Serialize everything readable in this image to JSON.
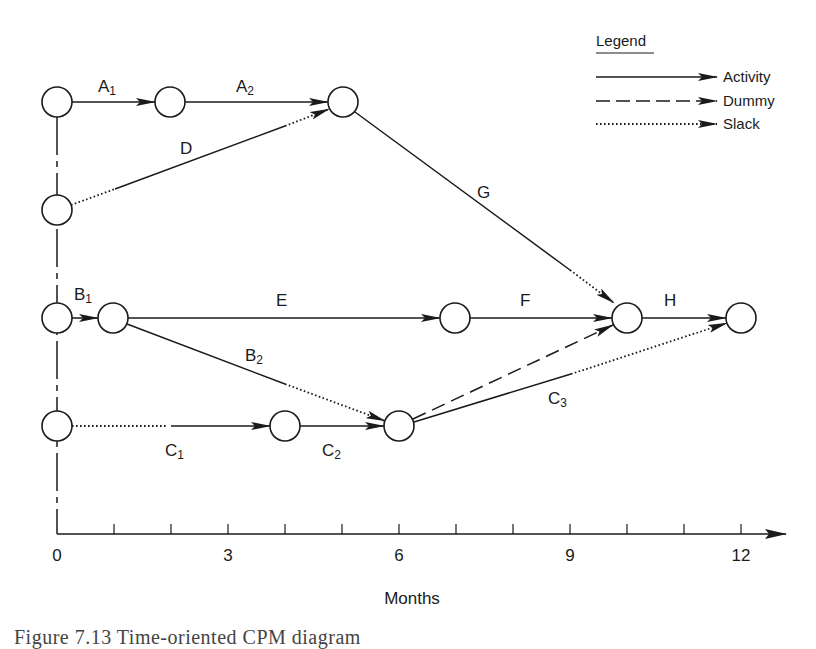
{
  "diagram": {
    "type": "time-oriented CPM network diagram",
    "axis": {
      "label": "Months",
      "ticks": [
        0,
        1,
        2,
        3,
        4,
        5,
        6,
        7,
        8,
        9,
        10,
        11,
        12
      ],
      "labeled_ticks": [
        "0",
        "3",
        "6",
        "9",
        "12"
      ]
    },
    "legend": {
      "title": "Legend",
      "items": [
        {
          "label": "Activity",
          "style": "solid"
        },
        {
          "label": "Dummy",
          "style": "dashed"
        },
        {
          "label": "Slack",
          "style": "dotted"
        }
      ]
    },
    "nodes": [
      {
        "id": "n1",
        "month": 0,
        "row": 0
      },
      {
        "id": "n2",
        "month": 2,
        "row": 0
      },
      {
        "id": "n3",
        "month": 5,
        "row": 0
      },
      {
        "id": "n4",
        "month": 0,
        "row": 1
      },
      {
        "id": "n5",
        "month": 0,
        "row": 2
      },
      {
        "id": "n6",
        "month": 1,
        "row": 2
      },
      {
        "id": "n7",
        "month": 7,
        "row": 2
      },
      {
        "id": "n8",
        "month": 10,
        "row": 2
      },
      {
        "id": "n9",
        "month": 12,
        "row": 2
      },
      {
        "id": "n10",
        "month": 0,
        "row": 3
      },
      {
        "id": "n11",
        "month": 4,
        "row": 3
      },
      {
        "id": "n12",
        "month": 6,
        "row": 3
      }
    ],
    "activities": [
      {
        "name": "A",
        "sub": "1",
        "from": "n1",
        "to": "n2",
        "duration": 2,
        "slack": 0
      },
      {
        "name": "A",
        "sub": "2",
        "from": "n2",
        "to": "n3",
        "duration": 3,
        "slack": 0
      },
      {
        "name": "D",
        "sub": "",
        "from": "n4",
        "to": "n3",
        "start_slack": 1,
        "duration": 3,
        "slack": 1
      },
      {
        "name": "G",
        "sub": "",
        "from": "n3",
        "to": "n8",
        "duration": 4,
        "slack": 1
      },
      {
        "name": "B",
        "sub": "1",
        "from": "n5",
        "to": "n6",
        "duration": 1,
        "slack": 0
      },
      {
        "name": "E",
        "sub": "",
        "from": "n6",
        "to": "n7",
        "duration": 6,
        "slack": 0
      },
      {
        "name": "F",
        "sub": "",
        "from": "n7",
        "to": "n8",
        "duration": 3,
        "slack": 0
      },
      {
        "name": "H",
        "sub": "",
        "from": "n8",
        "to": "n9",
        "duration": 2,
        "slack": 0
      },
      {
        "name": "B",
        "sub": "2",
        "from": "n6",
        "to": "n12",
        "duration": 3,
        "slack": 2
      },
      {
        "name": "C",
        "sub": "1",
        "from": "n10",
        "to": "n11",
        "start_slack": 2,
        "duration": 2,
        "slack": 0
      },
      {
        "name": "C",
        "sub": "2",
        "from": "n11",
        "to": "n12",
        "duration": 2,
        "slack": 0
      },
      {
        "name": "C",
        "sub": "3",
        "from": "n12",
        "to": "n9",
        "duration": 3,
        "slack": 3
      },
      {
        "name": "Dummy",
        "sub": "",
        "from": "n12",
        "to": "n8",
        "dummy": true
      }
    ],
    "labels": {
      "A1": {
        "main": "A",
        "sub": "1"
      },
      "A2": {
        "main": "A",
        "sub": "2"
      },
      "D": {
        "main": "D",
        "sub": ""
      },
      "G": {
        "main": "G",
        "sub": ""
      },
      "B1": {
        "main": "B",
        "sub": "1"
      },
      "E": {
        "main": "E",
        "sub": ""
      },
      "F": {
        "main": "F",
        "sub": ""
      },
      "H": {
        "main": "H",
        "sub": ""
      },
      "B2": {
        "main": "B",
        "sub": "2"
      },
      "C1": {
        "main": "C",
        "sub": "1"
      },
      "C2": {
        "main": "C",
        "sub": "2"
      },
      "C3": {
        "main": "C",
        "sub": "3"
      }
    }
  },
  "caption": {
    "text": "Figure 7.13   Time-oriented CPM diagram"
  },
  "colors": {
    "ink": "#1a1a1a",
    "background": "#ffffff"
  }
}
